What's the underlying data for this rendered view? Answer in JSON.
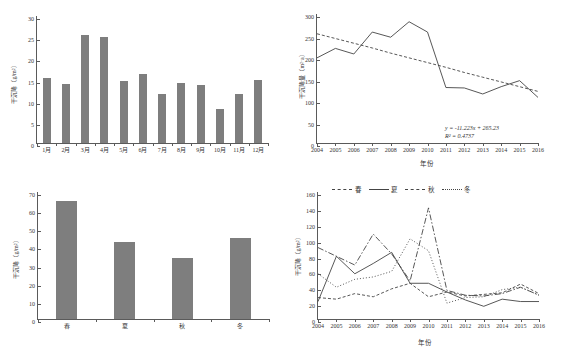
{
  "figure": {
    "panels": [
      "monthly-dry-deposition",
      "annual-dry-deposition-trend",
      "seasonal-dry-deposition",
      "seasonal-annual-dry-deposition"
    ]
  },
  "chart_data": [
    {
      "id": "monthly",
      "type": "bar",
      "title": "",
      "xlabel": "",
      "ylabel": "干沉降（g/m²）",
      "categories": [
        "1月",
        "2月",
        "3月",
        "4月",
        "5月",
        "6月",
        "7月",
        "8月",
        "9月",
        "10月",
        "11月",
        "12月"
      ],
      "values": [
        15.4,
        14.0,
        25.6,
        25.1,
        14.6,
        16.3,
        11.5,
        14.1,
        13.7,
        8.0,
        11.5,
        15.0
      ],
      "ylim": [
        0,
        30
      ],
      "yticks": [
        0,
        5,
        10,
        15,
        20,
        25,
        30
      ],
      "grid": false,
      "bar_color": "#7e7e7e"
    },
    {
      "id": "annual-trend",
      "type": "line",
      "title": "",
      "xlabel": "年份",
      "ylabel": "干沉降量（m²·a）",
      "x": [
        "2004",
        "2005",
        "2006",
        "2007",
        "2008",
        "2009",
        "2010",
        "2011",
        "2012",
        "2013",
        "2014",
        "2015",
        "2016"
      ],
      "series": [
        {
          "name": "干沉降量",
          "style": "solid",
          "values": [
            198,
            220,
            207,
            258,
            246,
            282,
            258,
            129,
            128,
            114,
            131,
            145,
            106
          ]
        },
        {
          "name": "线性趋势",
          "style": "dashed",
          "values": [
            254,
            243,
            232,
            221,
            209,
            198,
            187,
            176,
            164,
            153,
            142,
            131,
            120
          ]
        }
      ],
      "ylim": [
        0,
        300
      ],
      "yticks": [
        0,
        50,
        100,
        150,
        200,
        250,
        300
      ],
      "annotations": [
        "y = -11.223x + 265.23",
        "R² = 0.4737"
      ],
      "grid": false,
      "legend": "none"
    },
    {
      "id": "seasonal",
      "type": "bar",
      "title": "",
      "xlabel": "",
      "ylabel": "干沉降（g/m²）",
      "categories": [
        "春",
        "夏",
        "秋",
        "冬"
      ],
      "values": [
        65.2,
        42.2,
        33.4,
        44.6
      ],
      "ylim": [
        0,
        70
      ],
      "yticks": [
        0,
        10,
        20,
        30,
        40,
        50,
        60,
        70
      ],
      "grid": false,
      "bar_color": "#7e7e7e"
    },
    {
      "id": "seasonal-annual",
      "type": "line",
      "title": "",
      "xlabel": "年份",
      "ylabel": "干沉降（g/m²）",
      "x": [
        "2004",
        "2005",
        "2006",
        "2007",
        "2008",
        "2009",
        "2010",
        "2011",
        "2012",
        "2013",
        "2014",
        "2015",
        "2016"
      ],
      "series": [
        {
          "name": "春",
          "style": "dashdot",
          "values": [
            90,
            79,
            68,
            107,
            82,
            48,
            140,
            36,
            30,
            29,
            32,
            40,
            30
          ]
        },
        {
          "name": "夏",
          "style": "solid",
          "values": [
            22,
            79,
            57,
            70,
            84,
            45,
            45,
            34,
            24,
            16,
            25,
            22,
            22
          ]
        },
        {
          "name": "秋",
          "style": "dashed",
          "values": [
            27,
            25,
            32,
            28,
            38,
            45,
            28,
            34,
            29,
            31,
            33,
            44,
            32
          ]
        },
        {
          "name": "冬",
          "style": "dotted",
          "values": [
            57,
            40,
            50,
            53,
            60,
            101,
            86,
            20,
            27,
            28,
            37,
            40,
            30
          ]
        }
      ],
      "ylim": [
        0,
        160
      ],
      "yticks": [
        0,
        20,
        40,
        60,
        80,
        100,
        120,
        140,
        160
      ],
      "legend": [
        "春",
        "夏",
        "秋",
        "冬"
      ],
      "legend_position": "top",
      "grid": false
    }
  ],
  "labels": {
    "monthly_ylabel": "干沉降（g/m²）",
    "annual_ylabel": "干沉降量（m²·a）",
    "seasonal_ylabel": "干沉降（g/m²）",
    "seasonal_annual_ylabel": "干沉降（g/m²）",
    "year_axis": "年份",
    "equation": "y = -11.223x + 265.23",
    "r_squared": "R² = 0.4737"
  }
}
